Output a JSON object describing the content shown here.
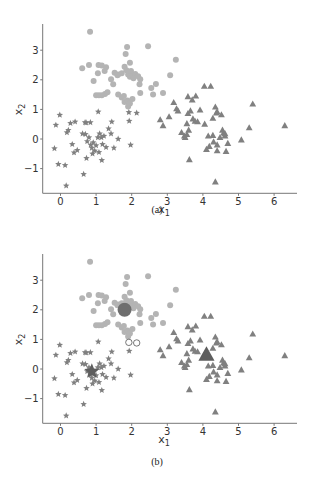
{
  "chart_data": [
    {
      "type": "scatter",
      "panel": "a",
      "caption": "(a)",
      "xlabel": "x1",
      "ylabel": "x2",
      "xlim": [
        -0.5,
        6.7
      ],
      "ylim": [
        -1.9,
        3.9
      ],
      "xticks": [
        0,
        1,
        2,
        3,
        4,
        5,
        6
      ],
      "yticks": [
        -1,
        0,
        1,
        2,
        3
      ],
      "grid": false,
      "legend": null,
      "series": [
        {
          "name": "cluster-circles",
          "marker": "circle",
          "color": "#b4b4b4",
          "points": [
            [
              0.83,
              3.62
            ],
            [
              1.87,
              3.11
            ],
            [
              2.46,
              3.13
            ],
            [
              3.24,
              2.68
            ],
            [
              1.83,
              2.87
            ],
            [
              1.95,
              2.58
            ],
            [
              0.61,
              2.39
            ],
            [
              0.8,
              2.5
            ],
            [
              1.07,
              2.5
            ],
            [
              1.16,
              2.48
            ],
            [
              1.28,
              2.42
            ],
            [
              1.05,
              2.22
            ],
            [
              0.93,
              1.96
            ],
            [
              1.24,
              2.3
            ],
            [
              1.42,
              2.02
            ],
            [
              1.52,
              2.24
            ],
            [
              1.62,
              2.18
            ],
            [
              1.72,
              2.22
            ],
            [
              1.8,
              2.44
            ],
            [
              1.85,
              2.32
            ],
            [
              1.9,
              2.18
            ],
            [
              1.95,
              2.1
            ],
            [
              2.02,
              2.14
            ],
            [
              2.1,
              2.2
            ],
            [
              2.18,
              2.12
            ],
            [
              2.24,
              2.02
            ],
            [
              2.22,
              1.85
            ],
            [
              1.48,
              1.85
            ],
            [
              1.6,
              2.15
            ],
            [
              3.08,
              2.15
            ],
            [
              2.55,
              1.72
            ],
            [
              2.68,
              1.86
            ],
            [
              2.6,
              1.5
            ],
            [
              2.88,
              1.55
            ],
            [
              2.24,
              1.55
            ],
            [
              1.0,
              1.48
            ],
            [
              1.08,
              1.48
            ],
            [
              1.16,
              1.48
            ],
            [
              1.25,
              1.52
            ],
            [
              1.32,
              1.58
            ],
            [
              1.62,
              1.5
            ],
            [
              1.72,
              1.4
            ],
            [
              1.8,
              1.25
            ],
            [
              1.88,
              1.3
            ],
            [
              1.95,
              1.2
            ],
            [
              2.02,
              1.35
            ],
            [
              1.9,
              1.1
            ],
            [
              1.78,
              1.45
            ],
            [
              2.05,
              2.05
            ],
            [
              1.98,
              2.3
            ]
          ]
        },
        {
          "name": "cluster-stars",
          "marker": "star",
          "color": "#808080",
          "points": [
            [
              -0.02,
              0.81
            ],
            [
              -0.13,
              0.47
            ],
            [
              1.06,
              0.92
            ],
            [
              1.92,
              0.9
            ],
            [
              2.14,
              0.88
            ],
            [
              1.93,
              0.61
            ],
            [
              0.28,
              0.53
            ],
            [
              0.41,
              0.58
            ],
            [
              0.69,
              0.56
            ],
            [
              0.84,
              0.56
            ],
            [
              1.44,
              0.58
            ],
            [
              -0.17,
              -0.32
            ],
            [
              -0.06,
              -0.85
            ],
            [
              0.13,
              -0.89
            ],
            [
              0.65,
              -1.19
            ],
            [
              0.16,
              -1.58
            ],
            [
              1.97,
              -0.2
            ],
            [
              1.16,
              -0.72
            ],
            [
              0.73,
              -0.65
            ],
            [
              0.18,
              0.22
            ],
            [
              0.22,
              0.3
            ],
            [
              0.33,
              -0.18
            ],
            [
              0.38,
              -0.46
            ],
            [
              0.47,
              -0.38
            ],
            [
              0.62,
              0.18
            ],
            [
              0.7,
              0.16
            ],
            [
              0.75,
              -0.08
            ],
            [
              0.8,
              0.05
            ],
            [
              0.85,
              -0.2
            ],
            [
              0.88,
              -0.3
            ],
            [
              0.92,
              -0.12
            ],
            [
              0.96,
              -0.4
            ],
            [
              1.0,
              -0.22
            ],
            [
              1.05,
              0.05
            ],
            [
              1.1,
              0.18
            ],
            [
              1.15,
              0.05
            ],
            [
              1.18,
              -0.18
            ],
            [
              1.22,
              0.1
            ],
            [
              1.28,
              -0.28
            ],
            [
              1.35,
              0.35
            ],
            [
              1.42,
              0.18
            ],
            [
              1.5,
              -0.3
            ],
            [
              1.62,
              0.0
            ],
            [
              0.72,
              0.55
            ],
            [
              1.08,
              -0.45
            ],
            [
              0.9,
              -0.5
            ]
          ]
        },
        {
          "name": "cluster-triangles",
          "marker": "triangle",
          "color": "#808080",
          "points": [
            [
              4.04,
              1.78
            ],
            [
              4.22,
              1.78
            ],
            [
              3.18,
              1.23
            ],
            [
              3.58,
              1.43
            ],
            [
              3.7,
              1.32
            ],
            [
              3.8,
              1.45
            ],
            [
              3.26,
              1.02
            ],
            [
              3.3,
              0.95
            ],
            [
              3.58,
              0.86
            ],
            [
              3.65,
              0.95
            ],
            [
              3.72,
              0.68
            ],
            [
              3.78,
              0.6
            ],
            [
              3.85,
              0.58
            ],
            [
              3.92,
              0.98
            ],
            [
              4.35,
              1.08
            ],
            [
              4.38,
              0.88
            ],
            [
              4.4,
              0.92
            ],
            [
              4.52,
              0.82
            ],
            [
              4.28,
              0.7
            ],
            [
              4.05,
              0.5
            ],
            [
              2.8,
              0.65
            ],
            [
              2.88,
              0.45
            ],
            [
              3.05,
              0.75
            ],
            [
              3.4,
              0.22
            ],
            [
              3.5,
              0.05
            ],
            [
              3.55,
              0.15
            ],
            [
              3.6,
              0.3
            ],
            [
              3.55,
              0.52
            ],
            [
              3.48,
              0.1
            ],
            [
              4.15,
              0.1
            ],
            [
              4.28,
              0.12
            ],
            [
              4.1,
              -0.35
            ],
            [
              4.18,
              -0.25
            ],
            [
              4.3,
              -0.1
            ],
            [
              4.4,
              -0.2
            ],
            [
              4.48,
              0.05
            ],
            [
              4.55,
              0.3
            ],
            [
              4.58,
              0.2
            ],
            [
              4.62,
              0.1
            ],
            [
              4.7,
              -0.15
            ],
            [
              4.65,
              -0.42
            ],
            [
              4.4,
              -0.4
            ],
            [
              5.08,
              -0.03
            ],
            [
              5.3,
              0.38
            ],
            [
              5.4,
              1.18
            ],
            [
              6.3,
              0.45
            ],
            [
              3.62,
              -0.7
            ],
            [
              4.35,
              -1.45
            ],
            [
              4.62,
              0.18
            ]
          ]
        }
      ]
    },
    {
      "type": "scatter",
      "panel": "b",
      "caption": "(b)",
      "xlabel": "x1",
      "ylabel": "x2",
      "xlim": [
        -0.5,
        6.7
      ],
      "ylim": [
        -1.9,
        3.9
      ],
      "xticks": [
        0,
        1,
        2,
        3,
        4,
        5,
        6
      ],
      "yticks": [
        -1,
        0,
        1,
        2,
        3
      ],
      "grid": false,
      "legend": null,
      "note": "Same data as (a) but the two ambiguous stars near (1.9,0.9) and (2.1,0.88) are drawn as open circles, and cluster centroids are drawn as large markers.",
      "reassigned_points": {
        "marker": "open-circle",
        "points": [
          [
            1.92,
            0.9
          ],
          [
            2.14,
            0.88
          ]
        ]
      },
      "centroids": [
        {
          "cluster": "circles",
          "marker": "circle",
          "x": 1.8,
          "y": 2.0,
          "color": "#6e6e6e"
        },
        {
          "cluster": "stars",
          "marker": "star",
          "x": 0.88,
          "y": -0.08,
          "color": "#5e5e5e"
        },
        {
          "cluster": "triangles",
          "marker": "triangle",
          "x": 4.1,
          "y": 0.48,
          "color": "#5e5e5e"
        }
      ]
    }
  ],
  "labels": {
    "x_axis": "x",
    "x_axis_sub": "1",
    "y_axis": "x",
    "y_axis_sub": "2",
    "caption_a": "(a)",
    "caption_b": "(b)"
  }
}
